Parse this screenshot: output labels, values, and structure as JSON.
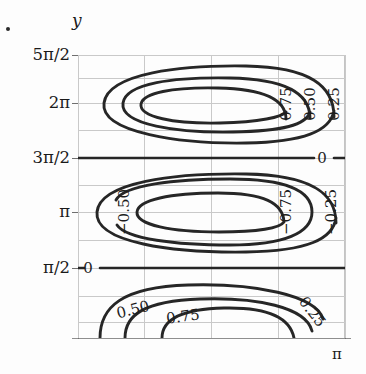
{
  "figure": {
    "kind": "contour-plot",
    "artifact_mark": "·"
  },
  "axes": {
    "y_title": "y",
    "x_title": "π",
    "y_ticks": [
      {
        "label": "5π/2",
        "y": 55
      },
      {
        "label": "2π",
        "y": 103
      },
      {
        "label": "3π/2",
        "y": 158
      },
      {
        "label": "π",
        "y": 212
      },
      {
        "label": "π/2",
        "y": 268
      }
    ],
    "grid": {
      "horizontal_y": [
        55,
        78,
        103,
        130,
        158,
        185,
        212,
        240,
        268,
        296,
        322
      ],
      "vertical_x": [
        78,
        144,
        211,
        278,
        345
      ],
      "x_tick_positions": [
        78,
        345
      ],
      "color": "#c9c9c9"
    },
    "frame": {
      "left": 78,
      "top": 55,
      "width": 267,
      "height": 283
    }
  },
  "chart_data": {
    "type": "line",
    "title": "",
    "xlabel": "π",
    "ylabel": "y",
    "xlim": [
      0,
      3.14159
    ],
    "ylim": [
      0,
      7.853981
    ],
    "ytick_labels": [
      "π/2",
      "π",
      "3π/2",
      "2π",
      "5π/2"
    ],
    "ytick_values": [
      1.5708,
      3.14159,
      4.71239,
      6.28319,
      7.85398
    ],
    "xtick_labels": [
      "π"
    ],
    "grid": true,
    "legend": "none",
    "contour_levels": [
      -0.75,
      -0.5,
      -0.25,
      0,
      0.25,
      0.5,
      0.75
    ],
    "lobes": [
      {
        "name": "upper-positive-lobe",
        "center_y": "2π",
        "sign": "positive",
        "levels": [
          0.25,
          0.5,
          0.75
        ],
        "labels": [
          {
            "text": "0.75",
            "x": 286,
            "y": 104,
            "rotation": -90
          },
          {
            "text": "0.50",
            "x": 310,
            "y": 104,
            "rotation": -90
          },
          {
            "text": "0.25",
            "x": 334,
            "y": 104,
            "rotation": -90
          }
        ]
      },
      {
        "name": "middle-negative-lobe",
        "center_y": "π",
        "sign": "negative",
        "levels": [
          -0.25,
          -0.5,
          -0.75
        ],
        "labels": [
          {
            "text": "−0.50",
            "x": 124,
            "y": 212,
            "rotation": -90
          },
          {
            "text": "−0.75",
            "x": 286,
            "y": 212,
            "rotation": -90
          },
          {
            "text": "−0.25",
            "x": 331,
            "y": 212,
            "rotation": -90
          }
        ]
      },
      {
        "name": "lower-positive-lobe",
        "center_y": "0",
        "sign": "positive",
        "levels": [
          0.25,
          0.5,
          0.75
        ],
        "labels": [
          {
            "text": "0.50",
            "x": 133,
            "y": 310,
            "rotation": -14
          },
          {
            "text": "0.75",
            "x": 183,
            "y": 317,
            "rotation": -8
          },
          {
            "text": "0.25",
            "x": 312,
            "y": 312,
            "rotation": 52
          }
        ]
      }
    ],
    "zero_lines": [
      {
        "level": 0,
        "at": "3π/2",
        "y": 158,
        "label": "0",
        "label_x": 322
      },
      {
        "level": 0,
        "at": "π/2",
        "y": 268,
        "label": "0",
        "label_x": 88
      }
    ]
  },
  "labels": {
    "zero_upper": "0",
    "zero_lower": "0"
  }
}
